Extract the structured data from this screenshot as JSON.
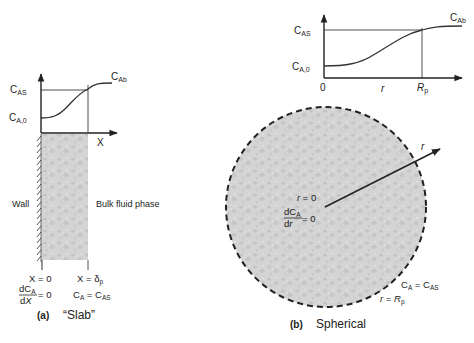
{
  "colors": {
    "line": "#222222",
    "fill": "#d4d4d4",
    "pore": "#c2c2c2"
  },
  "slab": {
    "chart": {
      "y_label_top": {
        "main": "C",
        "sub": "AS"
      },
      "y_label_bottom": {
        "main": "C",
        "sub": "A,0"
      },
      "curve_end_label": {
        "main": "C",
        "sub": "Ab"
      },
      "x_axis_label": "X"
    },
    "wall_label": "Wall",
    "bulk_label": "Bulk fluid phase",
    "boundary_left": {
      "position": "X = 0",
      "condition_num": {
        "main": "dC",
        "sub": "A"
      },
      "condition_den": "dX",
      "condition_rhs": "= 0"
    },
    "boundary_right": {
      "position_prefix": "X = δ",
      "position_sub": "p",
      "condition": {
        "lhs_main": "C",
        "lhs_sub": "A",
        "eq": " = ",
        "rhs_main": "C",
        "rhs_sub": "AS"
      }
    },
    "caption_letter": "(a)",
    "caption_text": "“Slab”"
  },
  "sphere": {
    "chart": {
      "y_label_top": {
        "main": "C",
        "sub": "AS"
      },
      "y_label_bottom": {
        "main": "C",
        "sub": "A,0"
      },
      "curve_end_label": {
        "main": "C",
        "sub": "Ab"
      },
      "origin_label": "0",
      "x_axis_label": "r",
      "x_tick_label": {
        "main": "R",
        "sub": "p"
      }
    },
    "radius_arrow_label": "r",
    "center": {
      "position": "r = 0",
      "condition_num": {
        "main": "dC",
        "sub": "A"
      },
      "condition_den": "dr",
      "condition_rhs": "= 0"
    },
    "surface": {
      "condition": {
        "lhs_main": "C",
        "lhs_sub": "A",
        "eq": " = ",
        "rhs_main": "C",
        "rhs_sub": "AS"
      },
      "position": {
        "main": "r = R",
        "sub": "p"
      }
    },
    "caption_letter": "(b)",
    "caption_text": "Spherical"
  }
}
